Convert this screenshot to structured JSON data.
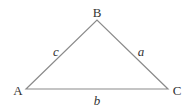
{
  "diagram": {
    "type": "triangle",
    "line_color": "#8a8a8a",
    "text_color": "#333333",
    "vertices": [
      {
        "label": "A",
        "x": 26,
        "y": 89,
        "label_x": 18,
        "label_y": 90
      },
      {
        "label": "B",
        "x": 97,
        "y": 20,
        "label_x": 97,
        "label_y": 12
      },
      {
        "label": "C",
        "x": 168,
        "y": 89,
        "label_x": 177,
        "label_y": 90
      }
    ],
    "sides": [
      {
        "label": "c",
        "from": "A",
        "to": "B",
        "label_x": 56,
        "label_y": 51
      },
      {
        "label": "a",
        "from": "B",
        "to": "C",
        "label_x": 141,
        "label_y": 51
      },
      {
        "label": "b",
        "from": "A",
        "to": "C",
        "label_x": 97,
        "label_y": 100
      }
    ]
  }
}
